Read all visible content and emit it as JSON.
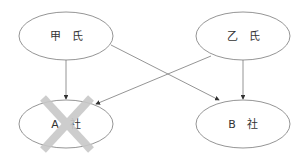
{
  "nodes": {
    "kou": {
      "label": "甲　氏"
    },
    "otsu": {
      "label": "乙　氏"
    },
    "a_company": {
      "label": "A　社",
      "crossed_out": true
    },
    "b_company": {
      "label": "B　社"
    }
  },
  "edges": [
    {
      "from": "kou",
      "to": "a_company"
    },
    {
      "from": "kou",
      "to": "b_company"
    },
    {
      "from": "otsu",
      "to": "a_company"
    },
    {
      "from": "otsu",
      "to": "b_company"
    }
  ],
  "colors": {
    "line": "#7a7a7a",
    "cross": "#c8c8c8",
    "text": "#333333"
  }
}
